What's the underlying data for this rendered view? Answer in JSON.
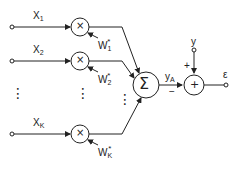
{
  "diagram": {
    "type": "adaptive linear combiner",
    "inputs": [
      {
        "label": "X",
        "sub": "1",
        "weight": "W",
        "weight_sub": "1",
        "weight_sup": "*"
      },
      {
        "label": "X",
        "sub": "2",
        "weight": "W",
        "weight_sub": "2",
        "weight_sup": "*"
      },
      {
        "label": "X",
        "sub": "K",
        "weight": "W",
        "weight_sub": "K",
        "weight_sup": "*"
      }
    ],
    "multiplier_symbol": "×",
    "summer_symbol": "Σ",
    "adder_symbol": "+",
    "output": {
      "label": "y",
      "sub": "A"
    },
    "desired": {
      "label": "y"
    },
    "error": {
      "label": "ε"
    },
    "sign_plus": "+",
    "sign_minus": "−",
    "ellipsis": "⋮"
  },
  "colors": {
    "stroke": "#222222",
    "background": "#ffffff"
  }
}
